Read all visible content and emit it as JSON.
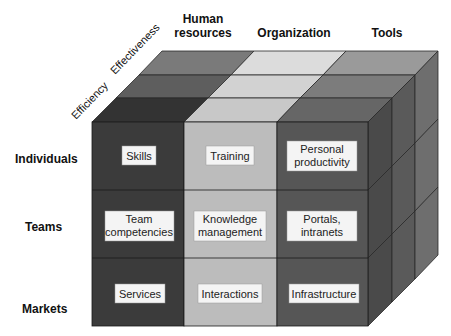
{
  "diagram": {
    "type": "3d-cube-matrix",
    "columns": [
      {
        "label_lines": [
          "Human",
          "resources"
        ]
      },
      {
        "label_lines": [
          "Organization"
        ]
      },
      {
        "label_lines": [
          "Tools"
        ]
      }
    ],
    "rows": [
      {
        "label": "Individuals"
      },
      {
        "label": "Teams"
      },
      {
        "label": "Markets"
      }
    ],
    "depth_axis": [
      {
        "label": "Efficiency"
      },
      {
        "label": "Effectiveness"
      }
    ],
    "cells": [
      [
        {
          "lines": [
            "Skills"
          ]
        },
        {
          "lines": [
            "Training"
          ]
        },
        {
          "lines": [
            "Personal",
            "productivity"
          ]
        }
      ],
      [
        {
          "lines": [
            "Team",
            "competencies"
          ]
        },
        {
          "lines": [
            "Knowledge",
            "management"
          ]
        },
        {
          "lines": [
            "Portals,",
            "intranets"
          ]
        }
      ],
      [
        {
          "lines": [
            "Services"
          ]
        },
        {
          "lines": [
            "Interactions"
          ]
        },
        {
          "lines": [
            "Infrastructure"
          ]
        }
      ]
    ],
    "colors": {
      "hr_front": "#3b3b3b",
      "org_front": "#bcbcbc",
      "tools_front": "#565656",
      "outline": "#1a1a1a",
      "label_box": "#f4f4f4"
    }
  }
}
